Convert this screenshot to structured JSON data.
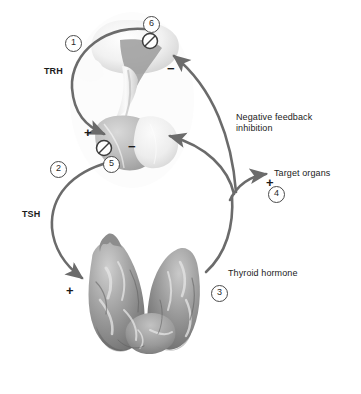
{
  "figure": {
    "type": "biological-diagram",
    "background": "#ffffff",
    "line_color": "#6b6b6b",
    "text_color": "#1b1b1b"
  },
  "labels": {
    "trh": "TRH",
    "tsh": "TSH",
    "negative_feedback": "Negative feedback",
    "inhibition": "inhibition",
    "target_organs": "Target organs",
    "thyroid_hormone": "Thyroid hormone"
  },
  "markers": {
    "m1": "1",
    "m2": "2",
    "m3": "3",
    "m4": "4",
    "m5": "5",
    "m6": "6"
  },
  "signs": {
    "plus_pituitary": "+",
    "minus_pituitary": "−",
    "minus_hypothalamus": "−",
    "plus_target": "+",
    "plus_thyroid": "+"
  },
  "anatomy": {
    "hypothalamus": "hypothalamus",
    "pituitary_anterior": "anterior-pituitary",
    "pituitary_posterior": "posterior-pituitary",
    "infundibulum": "pituitary-stalk",
    "thyroid": "thyroid-gland"
  },
  "inhibition_icons": {
    "icon5": "blocked-circle",
    "icon6": "blocked-circle"
  },
  "colors": {
    "arrow": "#6b6b6b",
    "brain_light": "#f2f2f2",
    "brain_mid": "#d6d6d6",
    "brain_dark": "#9a9a9a",
    "thyroid_mid": "#9d9d9d",
    "thyroid_dark": "#6a6a6a",
    "thyroid_light": "#d8d8d8"
  }
}
